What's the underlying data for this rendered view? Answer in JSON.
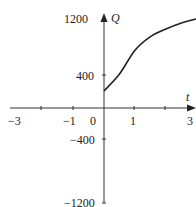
{
  "chart_data": {
    "type": "line",
    "title": "",
    "xlabel": "t",
    "ylabel": "Q",
    "xlim": [
      -3,
      3
    ],
    "ylim": [
      -1200,
      1200
    ],
    "x_ticks": [
      -3,
      -2,
      -1,
      0,
      1,
      2,
      3
    ],
    "x_tick_labels": [
      "-3",
      "-1",
      "0",
      "1",
      "3"
    ],
    "y_tick_labels": [
      "1200",
      "400",
      "-400",
      "-1200"
    ],
    "grid": false,
    "series": [
      {
        "name": "Q(t)",
        "x": [
          0,
          0.5,
          1,
          1.5,
          2,
          2.5,
          3
        ],
        "values": [
          200,
          400,
          680,
          840,
          930,
          1000,
          1050
        ]
      }
    ]
  },
  "labels": {
    "x_axis": "t",
    "y_axis": "Q",
    "x_m3": "−3",
    "x_m1": "−1",
    "x_0": "0",
    "x_1": "1",
    "x_3": "3",
    "y_1200": "1200",
    "y_400": "400",
    "y_m400": "−400",
    "y_m1200": "−1200"
  },
  "colors": {
    "axis": "#333333",
    "curve": "#222222",
    "text": "#222222"
  }
}
